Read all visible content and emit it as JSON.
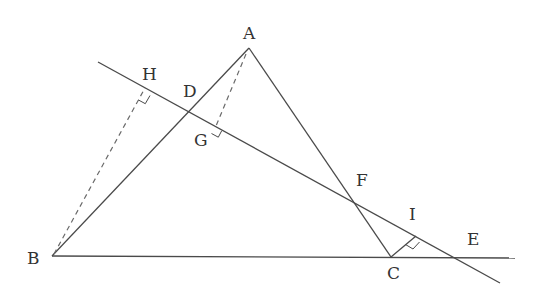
{
  "diagram": {
    "type": "geometry",
    "points": {
      "A": {
        "label": "A",
        "x": 249,
        "y": 48
      },
      "B": {
        "label": "B",
        "x": 52,
        "y": 256
      },
      "C": {
        "label": "C",
        "x": 391,
        "y": 257
      },
      "D": {
        "label": "D",
        "x": 190,
        "y": 112
      },
      "E": {
        "label": "E",
        "x": 455,
        "y": 258
      },
      "F": {
        "label": "F",
        "x": 353,
        "y": 202
      },
      "G": {
        "label": "G",
        "x": 216,
        "y": 126
      },
      "H": {
        "label": "H",
        "x": 145,
        "y": 88
      },
      "I": {
        "label": "I",
        "x": 416,
        "y": 236
      }
    },
    "segments": [
      {
        "from": "A",
        "to": "B",
        "style": "solid"
      },
      {
        "from": "A",
        "to": "C",
        "style": "solid"
      },
      {
        "from": "B",
        "to": "E",
        "style": "solid",
        "extended": true
      },
      {
        "from": "H",
        "to": "E",
        "style": "solid",
        "extended": true
      },
      {
        "from": "B",
        "to": "H",
        "style": "dashed"
      },
      {
        "from": "A",
        "to": "G",
        "style": "dashed"
      },
      {
        "from": "C",
        "to": "I",
        "style": "solid"
      }
    ],
    "right_angles": [
      "H",
      "G",
      "I"
    ],
    "labels": {
      "A": "A",
      "B": "B",
      "C": "C",
      "D": "D",
      "E": "E",
      "F": "F",
      "G": "G",
      "H": "H",
      "I": "I"
    },
    "colors": {
      "line": "#4a4a4a",
      "dashed": "#6a6a6a",
      "text": "#333333",
      "background": "#ffffff"
    }
  }
}
